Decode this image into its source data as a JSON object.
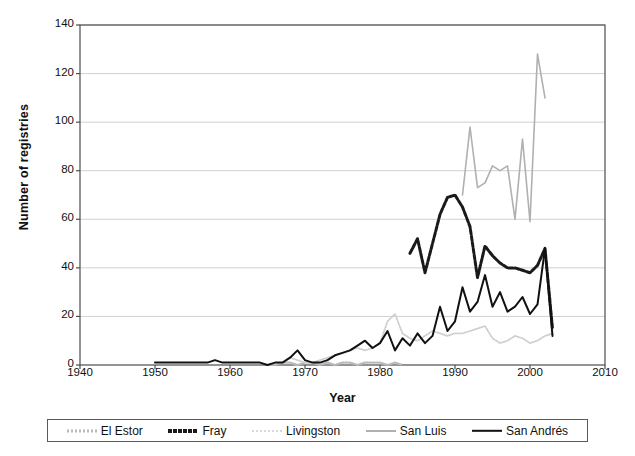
{
  "chart_data": {
    "type": "line",
    "title": "",
    "xlabel": "Year",
    "ylabel": "Number of registries",
    "xlim": [
      1940,
      2010
    ],
    "ylim": [
      0,
      140
    ],
    "xticks": [
      1940,
      1950,
      1960,
      1970,
      1980,
      1990,
      2000,
      2010
    ],
    "yticks": [
      0,
      20,
      40,
      60,
      80,
      100,
      120,
      140
    ],
    "grid": "horizontal",
    "legend_position": "bottom",
    "series": [
      {
        "name": "El Estor",
        "style": "dotted",
        "color": "#b9b9b9",
        "x": [
          1965,
          1966,
          1967,
          1968,
          1969,
          1970,
          1971,
          1972,
          1973,
          1974,
          1975,
          1976,
          1977,
          1978,
          1979,
          1980,
          1981,
          1982,
          1983
        ],
        "values": [
          0,
          0,
          1,
          1,
          0,
          1,
          1,
          0,
          1,
          0,
          1,
          1,
          0,
          1,
          1,
          1,
          0,
          1,
          0
        ]
      },
      {
        "name": "Fray",
        "style": "dashed-thick",
        "color": "#1a1a1a",
        "x": [
          1984,
          1985,
          1986,
          1987,
          1988,
          1989,
          1990,
          1991,
          1992,
          1993,
          1994,
          1995,
          1996,
          1997,
          1998,
          1999,
          2000,
          2001,
          2002,
          2003
        ],
        "values": [
          46,
          52,
          38,
          50,
          62,
          69,
          70,
          65,
          57,
          36,
          49,
          45,
          42,
          40,
          40,
          39,
          38,
          41,
          48,
          15
        ]
      },
      {
        "name": "Livingston",
        "style": "dotted",
        "color": "#cfcfcf",
        "x": [
          1968,
          1969,
          1970,
          1971,
          1972,
          1973,
          1974,
          1975,
          1976,
          1977,
          1978,
          1979,
          1980,
          1981,
          1982,
          1983,
          1984,
          1985,
          1986,
          1987,
          1988,
          1989,
          1990,
          1991,
          1992,
          1993,
          1994,
          1995,
          1996,
          1997,
          1998,
          1999,
          2000,
          2001,
          2002,
          2003
        ],
        "values": [
          3,
          2,
          1,
          1,
          2,
          3,
          4,
          5,
          6,
          7,
          6,
          7,
          9,
          18,
          21,
          13,
          11,
          10,
          12,
          14,
          13,
          12,
          13,
          13,
          14,
          15,
          16,
          11,
          9,
          10,
          12,
          11,
          9,
          10,
          12,
          13
        ]
      },
      {
        "name": "San Luis",
        "style": "solid",
        "color": "#b0b0b0",
        "x": [
          1991,
          1992,
          1993,
          1994,
          1995,
          1996,
          1997,
          1998,
          1999,
          2000,
          2001,
          2002
        ],
        "values": [
          70,
          98,
          73,
          75,
          82,
          80,
          82,
          60,
          93,
          59,
          128,
          110
        ]
      },
      {
        "name": "San Andrés",
        "style": "solid",
        "color": "#111111",
        "x": [
          1950,
          1951,
          1952,
          1953,
          1954,
          1955,
          1956,
          1957,
          1958,
          1959,
          1960,
          1961,
          1962,
          1963,
          1964,
          1965,
          1966,
          1967,
          1968,
          1969,
          1970,
          1971,
          1972,
          1973,
          1974,
          1975,
          1976,
          1977,
          1978,
          1979,
          1980,
          1981,
          1982,
          1983,
          1984,
          1985,
          1986,
          1987,
          1988,
          1989,
          1990,
          1991,
          1992,
          1993,
          1994,
          1995,
          1996,
          1997,
          1998,
          1999,
          2000,
          2001,
          2002,
          2003
        ],
        "values": [
          1,
          1,
          1,
          1,
          1,
          1,
          1,
          1,
          2,
          1,
          1,
          1,
          1,
          1,
          1,
          0,
          1,
          1,
          3,
          6,
          2,
          1,
          1,
          2,
          4,
          5,
          6,
          8,
          10,
          7,
          9,
          14,
          6,
          11,
          8,
          13,
          9,
          12,
          24,
          14,
          18,
          32,
          22,
          26,
          37,
          24,
          30,
          22,
          24,
          28,
          21,
          25,
          48,
          12
        ]
      }
    ]
  },
  "axes": {
    "ylabel": "Number of registries",
    "xlabel": "Year",
    "yticks": [
      "0",
      "20",
      "40",
      "60",
      "80",
      "100",
      "120",
      "140"
    ],
    "xticks": [
      "1940",
      "1950",
      "1960",
      "1970",
      "1980",
      "1990",
      "2000",
      "2010"
    ]
  },
  "legend": {
    "items": [
      {
        "label": "El Estor",
        "swatch": "dotted-light-line-icon"
      },
      {
        "label": "Fray",
        "swatch": "dashed-dark-line-icon"
      },
      {
        "label": "Livingston",
        "swatch": "dotted-gray-line-icon"
      },
      {
        "label": "San Luis",
        "swatch": "solid-gray-line-icon"
      },
      {
        "label": "San Andrés",
        "swatch": "solid-black-line-icon"
      }
    ]
  },
  "colors": {
    "frame": "#4d4d4d",
    "grid": "#d0d0d0",
    "el_estor": "#b9b9b9",
    "fray": "#1a1a1a",
    "livingston": "#cfcfcf",
    "san_luis": "#b0b0b0",
    "san_andres": "#111111"
  }
}
